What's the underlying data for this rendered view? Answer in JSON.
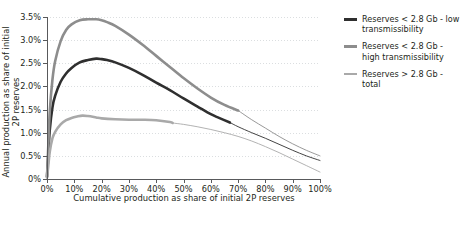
{
  "chart_data": {
    "type": "line",
    "title": "",
    "xlabel": "Cumulative production as share of initial 2P reserves",
    "ylabel": "Annual production as share of initial 2P reserves",
    "xlim": [
      0,
      100
    ],
    "ylim": [
      0,
      3.5
    ],
    "grid": "horizontal-dotted",
    "legend_position": "right",
    "x_tick_labels": [
      "0%",
      "10%",
      "20%",
      "30%",
      "40%",
      "50%",
      "60%",
      "70%",
      "80%",
      "90%",
      "100%"
    ],
    "x_tick_values": [
      0,
      10,
      20,
      30,
      40,
      50,
      60,
      70,
      80,
      90,
      100
    ],
    "y_tick_labels": [
      "0%",
      "0.5%",
      "1.0%",
      "1.5%",
      "2.0%",
      "2.5%",
      "3.0%",
      "3.5%"
    ],
    "y_tick_values": [
      0,
      0.5,
      1.0,
      1.5,
      2.0,
      2.5,
      3.0,
      3.5
    ],
    "series": [
      {
        "name": "Reserves < 2.8 Gb - low transmissibility",
        "color": "#2f2f2f",
        "thick_end_x": 67,
        "x": [
          0,
          0.5,
          1,
          2,
          3,
          5,
          7,
          9,
          12,
          15,
          18,
          20,
          22,
          25,
          30,
          35,
          40,
          45,
          50,
          55,
          60,
          63,
          67,
          70,
          75,
          80,
          85,
          90,
          95,
          100
        ],
        "y": [
          0.05,
          0.55,
          1.05,
          1.55,
          1.8,
          2.1,
          2.28,
          2.4,
          2.52,
          2.57,
          2.6,
          2.59,
          2.57,
          2.52,
          2.4,
          2.25,
          2.08,
          1.92,
          1.74,
          1.57,
          1.4,
          1.32,
          1.22,
          1.13,
          1.0,
          0.88,
          0.75,
          0.62,
          0.5,
          0.4
        ]
      },
      {
        "name": "Reserves < 2.8 Gb - high transmissibility",
        "color": "#8d8d8d",
        "thick_end_x": 70,
        "x": [
          0,
          0.5,
          1,
          2,
          3,
          5,
          7,
          9,
          12,
          15,
          18,
          20,
          22,
          25,
          30,
          35,
          40,
          45,
          50,
          55,
          60,
          65,
          70,
          75,
          80,
          85,
          90,
          95,
          100
        ],
        "y": [
          0.05,
          0.75,
          1.45,
          2.15,
          2.55,
          2.98,
          3.22,
          3.34,
          3.43,
          3.45,
          3.45,
          3.43,
          3.39,
          3.31,
          3.12,
          2.9,
          2.66,
          2.42,
          2.18,
          1.96,
          1.76,
          1.6,
          1.48,
          1.28,
          1.1,
          0.92,
          0.76,
          0.62,
          0.5
        ]
      },
      {
        "name": "Reserves > 2.8 Gb - total",
        "color": "#a9a9a9",
        "thick_end_x": 46,
        "x": [
          0,
          0.5,
          1,
          2,
          3,
          5,
          7,
          9,
          11,
          13,
          15,
          18,
          20,
          25,
          30,
          35,
          40,
          45,
          46,
          50,
          55,
          60,
          65,
          70,
          75,
          80,
          85,
          90,
          95,
          100
        ],
        "y": [
          0.03,
          0.3,
          0.58,
          0.88,
          1.02,
          1.18,
          1.27,
          1.32,
          1.35,
          1.37,
          1.36,
          1.33,
          1.31,
          1.29,
          1.28,
          1.28,
          1.27,
          1.23,
          1.21,
          1.18,
          1.13,
          1.07,
          1.0,
          0.92,
          0.82,
          0.7,
          0.57,
          0.43,
          0.29,
          0.15
        ]
      }
    ]
  },
  "legend": {
    "items": [
      {
        "label": "Reserves < 2.8 Gb - low transmissibility",
        "color": "#2f2f2f"
      },
      {
        "label": "Reserves < 2.8 Gb - high transmissibility",
        "color": "#8d8d8d"
      },
      {
        "label": "Reserves > 2.8 Gb - total",
        "color": "#a9a9a9"
      }
    ]
  }
}
